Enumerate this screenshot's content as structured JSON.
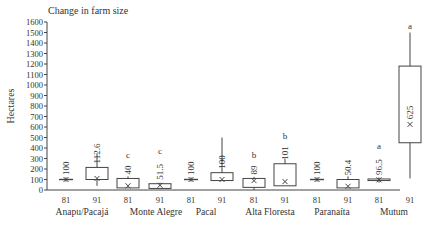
{
  "chart_data": {
    "type": "box",
    "title": "Change in farm size",
    "xlabel": "",
    "ylabel": "Hectares",
    "ylim": [
      0,
      1600
    ],
    "yticks": [
      0,
      100,
      200,
      300,
      400,
      500,
      600,
      700,
      800,
      900,
      1000,
      1100,
      1200,
      1300,
      1400,
      1500,
      1600
    ],
    "grid": false,
    "groups": [
      {
        "name": "Anapu/Pacajá",
        "boxes": [
          {
            "year": "81",
            "min": 80,
            "q1": 95,
            "q3": 105,
            "max": 120,
            "mean": 100,
            "label": "100",
            "letter": ""
          },
          {
            "year": "91",
            "min": 40,
            "q1": 100,
            "q3": 215,
            "max": 350,
            "mean": 110,
            "label": "112.6",
            "letter": ""
          }
        ]
      },
      {
        "name": "Monte  Alegre",
        "boxes": [
          {
            "year": "81",
            "min": 20,
            "q1": 20,
            "q3": 110,
            "max": 130,
            "mean": 40,
            "label": "40",
            "letter": "c"
          },
          {
            "year": "91",
            "min": 15,
            "q1": 15,
            "q3": 60,
            "max": 70,
            "mean": 45,
            "label": "51.5",
            "letter": "c"
          }
        ]
      },
      {
        "name": "Pacal",
        "boxes": [
          {
            "year": "81",
            "min": 80,
            "q1": 95,
            "q3": 105,
            "max": 120,
            "mean": 100,
            "label": "100",
            "letter": ""
          },
          {
            "year": "91",
            "min": 90,
            "q1": 90,
            "q3": 165,
            "max": 500,
            "mean": 100,
            "label": "100",
            "letter": ""
          }
        ]
      },
      {
        "name": "Alta Floresta",
        "boxes": [
          {
            "year": "81",
            "min": 0,
            "q1": 25,
            "q3": 110,
            "max": 125,
            "mean": 89,
            "label": "89",
            "letter": "b"
          },
          {
            "year": "91",
            "min": 40,
            "q1": 40,
            "q3": 250,
            "max": 300,
            "mean": 80,
            "label": "101",
            "letter": "b"
          }
        ]
      },
      {
        "name": "Paranaíta",
        "boxes": [
          {
            "year": "81",
            "min": 80,
            "q1": 95,
            "q3": 105,
            "max": 120,
            "mean": 100,
            "label": "100",
            "letter": ""
          },
          {
            "year": "91",
            "min": 20,
            "q1": 20,
            "q3": 100,
            "max": 130,
            "mean": 35,
            "label": "50.4",
            "letter": ""
          }
        ]
      },
      {
        "name": "Mutum",
        "boxes": [
          {
            "year": "81",
            "min": 70,
            "q1": 90,
            "q3": 105,
            "max": 120,
            "mean": 96.5,
            "label": "96.5",
            "letter": "a"
          },
          {
            "year": "91",
            "min": 110,
            "q1": 450,
            "q3": 1180,
            "max": 1500,
            "mean": 625,
            "label": "625",
            "letter": "a"
          }
        ]
      }
    ]
  }
}
